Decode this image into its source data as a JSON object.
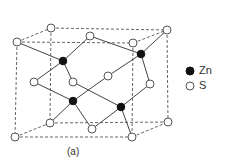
{
  "figure": {
    "caption": "(a)",
    "legend": [
      {
        "symbol": "filled-circle",
        "label": "Zn",
        "color": "#111111"
      },
      {
        "symbol": "open-circle",
        "label": "S",
        "color": "#ffffff"
      }
    ]
  }
}
